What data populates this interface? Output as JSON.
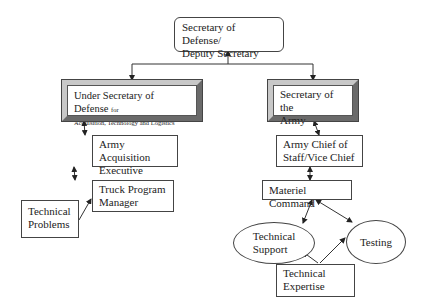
{
  "diagram": {
    "nodes": {
      "secdef": {
        "line1": "Secretary of Defense/",
        "line2": "Deputy Secretary"
      },
      "usd": {
        "main": "Under Secretary of Defense ",
        "for": "for",
        "line2": "Acquisition, Technology and Logistics"
      },
      "secarmy": {
        "line1": "Secretary of the",
        "line2": "Army"
      },
      "aae": {
        "line1": "Army Acquisition",
        "line2": "Executive"
      },
      "tpm": {
        "line1": "Truck Program",
        "line2": "Manager"
      },
      "techprob": {
        "line1": "Technical",
        "line2": "Problems"
      },
      "acs": {
        "line1": "Army Chief of",
        "line2": "Staff/Vice Chief"
      },
      "mc": {
        "line1": "Materiel Command"
      },
      "techsup": {
        "line1": "Technical",
        "line2": "Support"
      },
      "testing": {
        "line1": "Testing"
      },
      "techexp": {
        "line1": "Technical",
        "line2": "Expertise"
      }
    },
    "edges": [
      {
        "from": "secdef",
        "to": "usd",
        "type": "arrow"
      },
      {
        "from": "secdef",
        "to": "secarmy",
        "type": "arrow"
      },
      {
        "from": "usd",
        "to": "aae",
        "type": "bidirectional"
      },
      {
        "from": "aae",
        "to": "tpm",
        "type": "bidirectional"
      },
      {
        "from": "techprob",
        "to": "tpm",
        "type": "arrow"
      },
      {
        "from": "secarmy",
        "to": "acs",
        "type": "bidirectional"
      },
      {
        "from": "acs",
        "to": "mc",
        "type": "bidirectional"
      },
      {
        "from": "mc",
        "to": "techsup",
        "type": "bidirectional"
      },
      {
        "from": "mc",
        "to": "testing",
        "type": "bidirectional"
      },
      {
        "from": "techexp",
        "to": "techsup",
        "type": "arrow"
      },
      {
        "from": "techexp",
        "to": "testing",
        "type": "arrow"
      }
    ]
  }
}
